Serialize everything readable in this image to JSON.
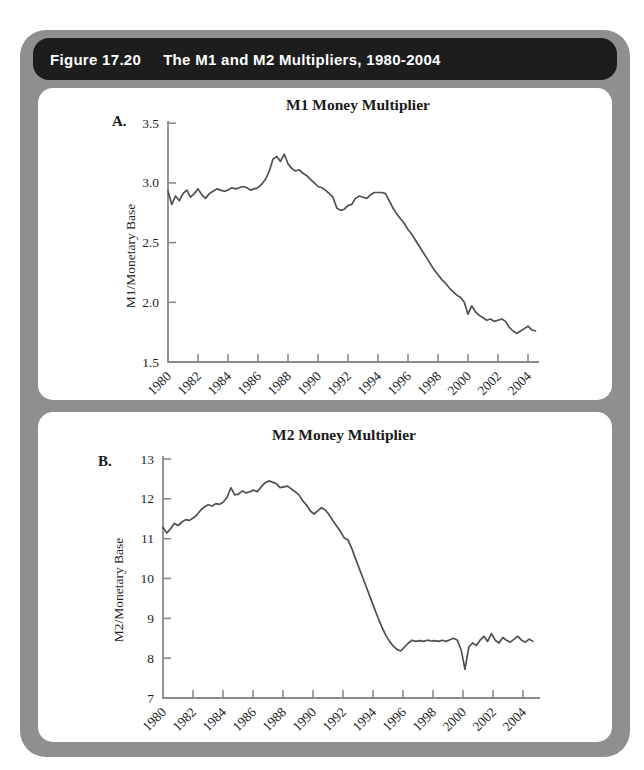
{
  "figure": {
    "label": "Figure 17.20",
    "title": "The M1 and M2 Multipliers, 1980-2004"
  },
  "colors": {
    "frame": "#8f8f8f",
    "header_bg": "#1d1d1d",
    "header_text": "#ffffff",
    "panel_bg": "#ffffff",
    "axis": "#8a8a8a",
    "line": "#505050",
    "text": "#1a1a1a"
  },
  "chart_data": [
    {
      "type": "line",
      "panel_label": "A.",
      "title": "M1 Money Multiplier",
      "ylabel": "M1/Monetary Base",
      "xlabel": "",
      "ylim": [
        1.5,
        3.5
      ],
      "ytick_values": [
        3.5,
        3.0,
        2.5,
        2.0,
        1.5
      ],
      "ytick_labels": [
        "3.5",
        "3.0",
        "2.5",
        "2.0",
        "1.5"
      ],
      "xtick_values": [
        1980,
        1982,
        1984,
        1986,
        1988,
        1990,
        1992,
        1994,
        1996,
        1998,
        2000,
        2002,
        2004
      ],
      "xtick_labels": [
        "1980",
        "1982",
        "1984",
        "1986",
        "1988",
        "1990",
        "1992",
        "1994",
        "1996",
        "1998",
        "2000",
        "2002",
        "2004"
      ],
      "xlim": [
        1980,
        2005.1
      ],
      "grid": false,
      "legend": "none",
      "series": [
        {
          "name": "M1 multiplier (quarterly)",
          "x": [
            1980.0,
            1980.25,
            1980.5,
            1980.75,
            1981.0,
            1981.25,
            1981.5,
            1981.75,
            1982.0,
            1982.25,
            1982.5,
            1982.75,
            1983.0,
            1983.25,
            1983.5,
            1983.75,
            1984.0,
            1984.25,
            1984.5,
            1984.75,
            1985.0,
            1985.25,
            1985.5,
            1985.75,
            1986.0,
            1986.25,
            1986.5,
            1986.75,
            1987.0,
            1987.25,
            1987.5,
            1987.75,
            1988.0,
            1988.25,
            1988.5,
            1988.75,
            1989.0,
            1989.25,
            1989.5,
            1989.75,
            1990.0,
            1990.25,
            1990.5,
            1990.75,
            1991.0,
            1991.25,
            1991.5,
            1991.75,
            1992.0,
            1992.25,
            1992.5,
            1992.75,
            1993.0,
            1993.25,
            1993.5,
            1993.75,
            1994.0,
            1994.25,
            1994.5,
            1994.75,
            1995.0,
            1995.25,
            1995.5,
            1995.75,
            1996.0,
            1996.25,
            1996.5,
            1996.75,
            1997.0,
            1997.25,
            1997.5,
            1997.75,
            1998.0,
            1998.25,
            1998.5,
            1998.75,
            1999.0,
            1999.25,
            1999.5,
            1999.75,
            2000.0,
            2000.25,
            2000.5,
            2000.75,
            2001.0,
            2001.25,
            2001.5,
            2001.75,
            2002.0,
            2002.25,
            2002.5,
            2002.75,
            2003.0,
            2003.25,
            2003.5,
            2003.75,
            2004.0,
            2004.25,
            2004.5
          ],
          "y": [
            2.93,
            2.82,
            2.89,
            2.85,
            2.91,
            2.94,
            2.88,
            2.91,
            2.95,
            2.9,
            2.87,
            2.91,
            2.93,
            2.95,
            2.94,
            2.93,
            2.94,
            2.96,
            2.95,
            2.96,
            2.97,
            2.96,
            2.94,
            2.95,
            2.96,
            2.99,
            3.03,
            3.1,
            3.2,
            3.22,
            3.18,
            3.24,
            3.16,
            3.12,
            3.1,
            3.11,
            3.08,
            3.06,
            3.03,
            3.0,
            2.97,
            2.96,
            2.94,
            2.91,
            2.88,
            2.79,
            2.77,
            2.78,
            2.81,
            2.82,
            2.87,
            2.89,
            2.88,
            2.87,
            2.9,
            2.92,
            2.92,
            2.92,
            2.91,
            2.85,
            2.79,
            2.74,
            2.7,
            2.66,
            2.61,
            2.57,
            2.52,
            2.47,
            2.42,
            2.37,
            2.32,
            2.27,
            2.23,
            2.19,
            2.16,
            2.12,
            2.09,
            2.06,
            2.04,
            2.0,
            1.9,
            1.97,
            1.92,
            1.89,
            1.87,
            1.85,
            1.86,
            1.84,
            1.85,
            1.86,
            1.84,
            1.79,
            1.76,
            1.74,
            1.76,
            1.78,
            1.8,
            1.77,
            1.76
          ]
        }
      ]
    },
    {
      "type": "line",
      "panel_label": "B.",
      "title": "M2 Money Multiplier",
      "ylabel": "M2/Monetary Base",
      "xlabel": "",
      "ylim": [
        7,
        13
      ],
      "ytick_values": [
        13,
        12,
        11,
        10,
        9,
        8,
        7
      ],
      "ytick_labels": [
        "13",
        "12",
        "11",
        "10",
        "9",
        "8",
        "7"
      ],
      "xtick_values": [
        1980,
        1982,
        1984,
        1986,
        1988,
        1990,
        1992,
        1994,
        1996,
        1998,
        2000,
        2002,
        2004
      ],
      "xtick_labels": [
        "1980",
        "1982",
        "1984",
        "1986",
        "1988",
        "1990",
        "1992",
        "1994",
        "1996",
        "1998",
        "2000",
        "2002",
        "2004"
      ],
      "xlim": [
        1980,
        2005.1
      ],
      "grid": false,
      "legend": "none",
      "series": [
        {
          "name": "M2 multiplier (quarterly)",
          "x": [
            1980.0,
            1980.25,
            1980.5,
            1980.75,
            1981.0,
            1981.25,
            1981.5,
            1981.75,
            1982.0,
            1982.25,
            1982.5,
            1982.75,
            1983.0,
            1983.25,
            1983.5,
            1983.75,
            1984.0,
            1984.25,
            1984.5,
            1984.75,
            1985.0,
            1985.25,
            1985.5,
            1985.75,
            1986.0,
            1986.25,
            1986.5,
            1986.75,
            1987.0,
            1987.25,
            1987.5,
            1987.75,
            1988.0,
            1988.25,
            1988.5,
            1988.75,
            1989.0,
            1989.25,
            1989.5,
            1989.75,
            1990.0,
            1990.25,
            1990.5,
            1990.75,
            1991.0,
            1991.25,
            1991.5,
            1991.75,
            1992.0,
            1992.25,
            1992.5,
            1992.75,
            1993.0,
            1993.25,
            1993.5,
            1993.75,
            1994.0,
            1994.25,
            1994.5,
            1994.75,
            1995.0,
            1995.25,
            1995.5,
            1995.75,
            1996.0,
            1996.25,
            1996.5,
            1996.75,
            1997.0,
            1997.25,
            1997.5,
            1997.75,
            1998.0,
            1998.25,
            1998.5,
            1998.75,
            1999.0,
            1999.25,
            1999.5,
            1999.75,
            2000.0,
            2000.25,
            2000.5,
            2000.75,
            2001.0,
            2001.25,
            2001.5,
            2001.75,
            2002.0,
            2002.25,
            2002.5,
            2002.75,
            2003.0,
            2003.25,
            2003.5,
            2003.75,
            2004.0,
            2004.25,
            2004.5
          ],
          "y": [
            11.28,
            11.14,
            11.25,
            11.38,
            11.33,
            11.42,
            11.48,
            11.46,
            11.52,
            11.6,
            11.72,
            11.8,
            11.85,
            11.82,
            11.88,
            11.86,
            11.92,
            12.05,
            12.28,
            12.1,
            12.12,
            12.2,
            12.15,
            12.18,
            12.22,
            12.18,
            12.3,
            12.4,
            12.45,
            12.42,
            12.38,
            12.28,
            12.3,
            12.32,
            12.25,
            12.18,
            12.1,
            11.95,
            11.85,
            11.7,
            11.62,
            11.7,
            11.78,
            11.72,
            11.6,
            11.45,
            11.32,
            11.18,
            11.02,
            10.97,
            10.75,
            10.5,
            10.25,
            10.0,
            9.75,
            9.5,
            9.25,
            9.0,
            8.78,
            8.58,
            8.42,
            8.3,
            8.22,
            8.18,
            8.28,
            8.38,
            8.45,
            8.42,
            8.44,
            8.42,
            8.45,
            8.43,
            8.44,
            8.42,
            8.45,
            8.42,
            8.46,
            8.5,
            8.45,
            8.2,
            7.72,
            8.28,
            8.38,
            8.32,
            8.45,
            8.55,
            8.42,
            8.62,
            8.45,
            8.38,
            8.52,
            8.45,
            8.4,
            8.48,
            8.55,
            8.45,
            8.4,
            8.48,
            8.42
          ]
        }
      ]
    }
  ]
}
